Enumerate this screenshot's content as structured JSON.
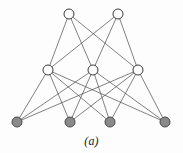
{
  "figure": {
    "caption": "(a)",
    "background_color": "#fdfdfd",
    "width": 183,
    "height": 153
  },
  "chart_data": {
    "type": "diagram",
    "subtype": "layered-bipartite-graph",
    "title": "(a)",
    "style": {
      "edge_color": "#4a4a4a",
      "edge_width": 0.7,
      "open_node_fill": "#ffffff",
      "open_node_stroke": "#3a3a3a",
      "filled_node_fill": "#8a8a8a",
      "filled_node_stroke": "#4a4a4a",
      "node_radius": 5.0,
      "node_stroke_width": 1.0
    },
    "layers": [
      {
        "name": "top",
        "index": 0,
        "node_style": "open",
        "count": 2
      },
      {
        "name": "middle",
        "index": 1,
        "node_style": "open",
        "count": 3
      },
      {
        "name": "bottom",
        "index": 2,
        "node_style": "filled",
        "count": 4
      }
    ],
    "nodes": [
      {
        "id": "t1",
        "layer": "top",
        "style": "open",
        "x": 69,
        "y": 14
      },
      {
        "id": "t2",
        "layer": "top",
        "style": "open",
        "x": 118,
        "y": 14
      },
      {
        "id": "m1",
        "layer": "middle",
        "style": "open",
        "x": 48,
        "y": 70
      },
      {
        "id": "m2",
        "layer": "middle",
        "style": "open",
        "x": 93,
        "y": 70
      },
      {
        "id": "m3",
        "layer": "middle",
        "style": "open",
        "x": 138,
        "y": 70
      },
      {
        "id": "b1",
        "layer": "bottom",
        "style": "filled",
        "x": 17,
        "y": 122
      },
      {
        "id": "b2",
        "layer": "bottom",
        "style": "filled",
        "x": 70,
        "y": 122
      },
      {
        "id": "b3",
        "layer": "bottom",
        "style": "filled",
        "x": 110,
        "y": 122
      },
      {
        "id": "b4",
        "layer": "bottom",
        "style": "filled",
        "x": 165,
        "y": 122
      }
    ],
    "edges": [
      {
        "from": "t1",
        "to": "m1"
      },
      {
        "from": "t1",
        "to": "m2"
      },
      {
        "from": "t1",
        "to": "m3"
      },
      {
        "from": "t2",
        "to": "m1"
      },
      {
        "from": "t2",
        "to": "m2"
      },
      {
        "from": "t2",
        "to": "m3"
      },
      {
        "from": "m1",
        "to": "b1"
      },
      {
        "from": "m1",
        "to": "b2"
      },
      {
        "from": "m1",
        "to": "b3"
      },
      {
        "from": "m1",
        "to": "b4"
      },
      {
        "from": "m2",
        "to": "b1"
      },
      {
        "from": "m2",
        "to": "b2"
      },
      {
        "from": "m2",
        "to": "b3"
      },
      {
        "from": "m2",
        "to": "b4"
      },
      {
        "from": "m3",
        "to": "b1"
      },
      {
        "from": "m3",
        "to": "b2"
      },
      {
        "from": "m3",
        "to": "b3"
      },
      {
        "from": "m3",
        "to": "b4"
      }
    ],
    "edge_count": 18,
    "node_count": 9
  }
}
